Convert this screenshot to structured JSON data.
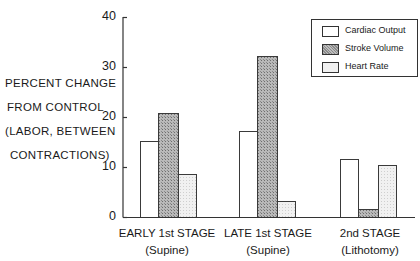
{
  "chart_data": {
    "type": "bar",
    "title": "",
    "ylabel": "PERCENT CHANGE FROM CONTROL (LABOR, BETWEEN CONTRACTIONS)",
    "ylabel_lines": [
      "PERCENT CHANGE",
      "FROM CONTROL",
      "(LABOR, BETWEEN",
      "CONTRACTIONS)"
    ],
    "xlabel": "",
    "ylim": [
      0,
      40
    ],
    "yticks": [
      0,
      10,
      20,
      30,
      40
    ],
    "ytick_labels": [
      "0",
      "10",
      "20",
      "30",
      "40"
    ],
    "grid": false,
    "legend_position": "upper right",
    "categories": [
      {
        "line1": "EARLY 1st STAGE",
        "line2": "(Supine)"
      },
      {
        "line1": "LATE 1st STAGE",
        "line2": "(Supine)"
      },
      {
        "line1": "2nd  STAGE",
        "line2": "(Lithotomy)"
      }
    ],
    "category_names": [
      "EARLY 1st STAGE (Supine)",
      "LATE 1st STAGE (Supine)",
      "2nd STAGE (Lithotomy)"
    ],
    "series": [
      {
        "name": "Cardiac Output",
        "fill": "white",
        "values": [
          15.2,
          17.2,
          11.6
        ]
      },
      {
        "name": "Stroke Volume",
        "fill": "dense-hatch",
        "values": [
          20.8,
          32.2,
          1.6
        ]
      },
      {
        "name": "Heart Rate",
        "fill": "light-stipple",
        "values": [
          8.6,
          3.2,
          10.4
        ]
      }
    ]
  },
  "legend": {
    "items": [
      {
        "label": "Cardiac Output"
      },
      {
        "label": "Stroke Volume"
      },
      {
        "label": "Heart Rate"
      }
    ]
  }
}
